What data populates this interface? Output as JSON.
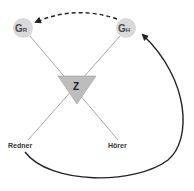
{
  "diagram": {
    "nodes": {
      "gr": {
        "main": "G",
        "sub": "R"
      },
      "gh": {
        "main": "G",
        "sub": "H"
      },
      "z": {
        "label": "Z"
      }
    },
    "roles": {
      "speaker": "Redner",
      "listener": "Hörer"
    },
    "edges": [
      {
        "from": "G_H",
        "to": "G_R",
        "style": "dashed",
        "shape": "arc"
      },
      {
        "from": "Redner",
        "to": "G_H",
        "style": "solid",
        "shape": "curve"
      },
      {
        "from": "G_R",
        "to": "Hörer",
        "style": "line",
        "through": "Z"
      },
      {
        "from": "G_H",
        "to": "Redner",
        "style": "line",
        "through": "Z"
      }
    ],
    "colors": {
      "node_fill": "#d9d9d9",
      "triangle_fill": "#bdbdbd",
      "line": "#a8a8a8",
      "arrow": "#222222"
    }
  }
}
